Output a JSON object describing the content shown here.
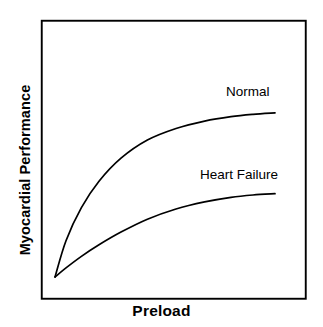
{
  "figure": {
    "width": 323,
    "height": 327,
    "background_color": "#ffffff",
    "line_color": "#000000"
  },
  "axes": {
    "x_title": "Preload",
    "y_title": "Myocardial Performance",
    "frame": {
      "left": 41,
      "top": 20,
      "right": 305,
      "bottom": 298
    }
  },
  "annotations": {
    "normal_label": "Normal",
    "heart_failure_label": "Heart Failure"
  },
  "chart_data": {
    "type": "line",
    "title": "",
    "xlabel": "Preload",
    "ylabel": "Myocardial Performance",
    "xlim": [
      0,
      1
    ],
    "ylim": [
      0,
      1
    ],
    "grid": false,
    "axis_ticks": false,
    "legend": "inline-curve-labels",
    "series": [
      {
        "name": "Normal",
        "label_position": {
          "x": 226,
          "y": 85
        },
        "x": [
          0.0,
          0.05,
          0.12,
          0.2,
          0.3,
          0.42,
          0.55,
          0.68,
          0.8,
          0.9,
          1.0
        ],
        "y": [
          0.0,
          0.22,
          0.42,
          0.58,
          0.72,
          0.83,
          0.9,
          0.945,
          0.972,
          0.986,
          0.995
        ]
      },
      {
        "name": "Heart Failure",
        "label_position": {
          "x": 200,
          "y": 168
        },
        "x": [
          0.0,
          0.05,
          0.12,
          0.2,
          0.3,
          0.42,
          0.55,
          0.68,
          0.8,
          0.9,
          1.0
        ],
        "y": [
          0.0,
          0.055,
          0.125,
          0.195,
          0.272,
          0.35,
          0.412,
          0.455,
          0.483,
          0.497,
          0.505
        ]
      }
    ]
  }
}
